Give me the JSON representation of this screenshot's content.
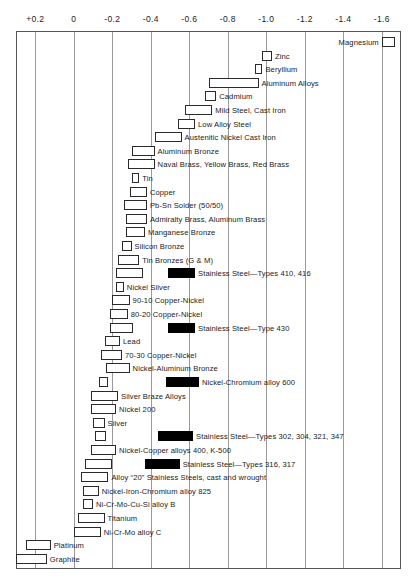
{
  "chart_data": {
    "type": "bar",
    "title": "",
    "subtitle": "",
    "xlabel": "Volts versus saturated calomel reference electrode",
    "ylabel": "",
    "orientation": "horizontal-range",
    "grid": true,
    "legend_position": "none",
    "axis": {
      "ticks": [
        "+0.2",
        "0",
        "-0.2",
        "-0.4",
        "-0.6",
        "-0.8",
        "-1.0",
        "-1.2",
        "-1.4",
        "-1.6"
      ],
      "tick_values": [
        0.2,
        0,
        -0.2,
        -0.4,
        -0.6,
        -0.8,
        -1.0,
        -1.2,
        -1.4,
        -1.6
      ],
      "xlim": [
        0.3,
        -1.7
      ],
      "direction": "decreasing-left-to-right"
    },
    "notes": {
      "filled_bar_meaning": "Alloys in the active (black) state",
      "open_bar_meaning": "Alloys in the passive (open) state"
    },
    "series": [
      {
        "name": "Magnesium",
        "start": -1.6,
        "end": -1.67,
        "filled": false,
        "label_side": "left"
      },
      {
        "name": "Zinc",
        "start": -0.98,
        "end": -1.03,
        "filled": false,
        "label_side": "right"
      },
      {
        "name": "Beryllium",
        "start": -0.94,
        "end": -0.98,
        "filled": false,
        "label_side": "right"
      },
      {
        "name": "Aluminum Alloys",
        "start": -0.7,
        "end": -0.96,
        "filled": false,
        "label_side": "right"
      },
      {
        "name": "Cadmium",
        "start": -0.68,
        "end": -0.74,
        "filled": false,
        "label_side": "right"
      },
      {
        "name": "Mild Steel, Cast Iron",
        "start": -0.58,
        "end": -0.72,
        "filled": false,
        "label_side": "right"
      },
      {
        "name": "Low Alloy Steel",
        "start": -0.54,
        "end": -0.63,
        "filled": false,
        "label_side": "right"
      },
      {
        "name": "Austenitic Nickel Cast Iron",
        "start": -0.42,
        "end": -0.56,
        "filled": false,
        "label_side": "right"
      },
      {
        "name": "Aluminum Bronze",
        "start": -0.3,
        "end": -0.42,
        "filled": false,
        "label_side": "right"
      },
      {
        "name": "Naval Brass, Yellow Brass, Red Brass",
        "start": -0.28,
        "end": -0.42,
        "filled": false,
        "label_side": "right"
      },
      {
        "name": "Tin",
        "start": -0.3,
        "end": -0.34,
        "filled": false,
        "label_side": "right"
      },
      {
        "name": "Copper",
        "start": -0.29,
        "end": -0.38,
        "filled": false,
        "label_side": "right"
      },
      {
        "name": "Pb-Sn Solder (50/50)",
        "start": -0.26,
        "end": -0.38,
        "filled": false,
        "label_side": "right"
      },
      {
        "name": "Admiralty Brass, Aluminum Brass",
        "start": -0.27,
        "end": -0.38,
        "filled": false,
        "label_side": "right"
      },
      {
        "name": "Manganese Bronze",
        "start": -0.27,
        "end": -0.37,
        "filled": false,
        "label_side": "right"
      },
      {
        "name": "Silicon Bronze",
        "start": -0.25,
        "end": -0.3,
        "filled": false,
        "label_side": "right"
      },
      {
        "name": "Tin Bronzes (G & M)",
        "start": -0.23,
        "end": -0.34,
        "filled": false,
        "label_side": "right"
      },
      {
        "name": "Stainless Steel—Types 410, 416",
        "start": -0.22,
        "end": -0.36,
        "filled": false,
        "label_side": "right",
        "extra_bar": {
          "start": -0.49,
          "end": -0.63,
          "filled": true
        }
      },
      {
        "name": "Nickel Silver",
        "start": -0.22,
        "end": -0.26,
        "filled": false,
        "label_side": "right"
      },
      {
        "name": "90-10 Copper-Nickel",
        "start": -0.2,
        "end": -0.29,
        "filled": false,
        "label_side": "right"
      },
      {
        "name": "80-20 Copper-Nickel",
        "start": -0.19,
        "end": -0.28,
        "filled": false,
        "label_side": "right"
      },
      {
        "name": "Stainless Steel—Type 430",
        "start": -0.19,
        "end": -0.31,
        "filled": false,
        "label_side": "right",
        "extra_bar": {
          "start": -0.49,
          "end": -0.63,
          "filled": true
        }
      },
      {
        "name": "Lead",
        "start": -0.16,
        "end": -0.24,
        "filled": false,
        "label_side": "right"
      },
      {
        "name": "70-30 Copper-Nickel",
        "start": -0.14,
        "end": -0.25,
        "filled": false,
        "label_side": "right"
      },
      {
        "name": "Nickel-Aluminum Bronze",
        "start": -0.17,
        "end": -0.29,
        "filled": false,
        "label_side": "right"
      },
      {
        "name": "Nickel-Chromium alloy 600",
        "start": -0.13,
        "end": -0.18,
        "filled": false,
        "label_side": "right",
        "extra_bar": {
          "start": -0.48,
          "end": -0.65,
          "filled": true
        }
      },
      {
        "name": "Silver Braze Alloys",
        "start": -0.09,
        "end": -0.23,
        "filled": false,
        "label_side": "right"
      },
      {
        "name": "Nickel 200",
        "start": -0.09,
        "end": -0.22,
        "filled": false,
        "label_side": "right"
      },
      {
        "name": "Silver",
        "start": -0.1,
        "end": -0.16,
        "filled": false,
        "label_side": "right"
      },
      {
        "name": "Stainless Steel—Types 302, 304, 321, 347",
        "start": -0.11,
        "end": -0.17,
        "filled": false,
        "label_side": "right",
        "extra_bar": {
          "start": -0.44,
          "end": -0.62,
          "filled": true
        }
      },
      {
        "name": "Nickel-Copper alloys 400, K-500",
        "start": -0.09,
        "end": -0.22,
        "filled": false,
        "label_side": "right"
      },
      {
        "name": "Stainless Steel—Types 316, 317",
        "start": -0.06,
        "end": -0.2,
        "filled": false,
        "label_side": "right",
        "extra_bar": {
          "start": -0.37,
          "end": -0.55,
          "filled": true
        }
      },
      {
        "name": "Alloy “20” Stainless Steels, cast and wrought",
        "start": -0.04,
        "end": -0.18,
        "filled": false,
        "label_side": "right"
      },
      {
        "name": "Nickel-Iron-Chromium alloy 825",
        "start": -0.05,
        "end": -0.13,
        "filled": false,
        "label_side": "right"
      },
      {
        "name": "Ni-Cr-Mo-Cu-Si alloy B",
        "start": -0.05,
        "end": -0.1,
        "filled": false,
        "label_side": "right"
      },
      {
        "name": "Titanium",
        "start": -0.02,
        "end": -0.16,
        "filled": false,
        "label_side": "right"
      },
      {
        "name": "Ni-Cr-Mo alloy C",
        "start": 0.0,
        "end": -0.14,
        "filled": false,
        "label_side": "right"
      },
      {
        "name": "Platinum",
        "start": 0.25,
        "end": 0.12,
        "filled": false,
        "label_side": "right"
      },
      {
        "name": "Graphite",
        "start": 0.3,
        "end": 0.14,
        "filled": false,
        "label_side": "right"
      }
    ]
  }
}
